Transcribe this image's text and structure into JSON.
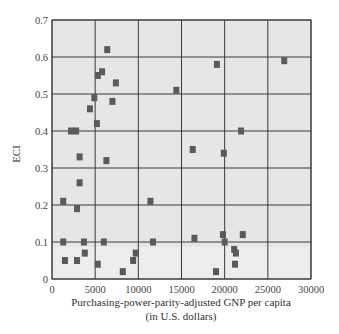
{
  "chart_data": {
    "type": "scatter",
    "title": "",
    "xlabel": "Purchasing-power-parity-adjusted GNP per capita",
    "xlabel_line2": "(in U.S. dollars)",
    "ylabel": "ECI",
    "xlim": [
      0,
      30000
    ],
    "ylim": [
      0,
      0.7
    ],
    "x_ticks": [
      "0",
      "5000",
      "10000",
      "15000",
      "20000",
      "25000",
      "30000"
    ],
    "y_ticks": [
      "0",
      "0.1",
      "0.2",
      "0.3",
      "0.4",
      "0.5",
      "0.6",
      "0.7"
    ],
    "grid": true,
    "legend": null,
    "colors": {
      "background": "#e6e6e6",
      "grid": "#3a3a3a",
      "marker": "#5a5a5a"
    },
    "points": [
      {
        "x": 6400,
        "y": 0.62
      },
      {
        "x": 5300,
        "y": 0.55
      },
      {
        "x": 5800,
        "y": 0.56
      },
      {
        "x": 7400,
        "y": 0.53
      },
      {
        "x": 4900,
        "y": 0.49
      },
      {
        "x": 7000,
        "y": 0.48
      },
      {
        "x": 4400,
        "y": 0.46
      },
      {
        "x": 5200,
        "y": 0.42
      },
      {
        "x": 2200,
        "y": 0.4
      },
      {
        "x": 2800,
        "y": 0.4
      },
      {
        "x": 3200,
        "y": 0.33
      },
      {
        "x": 6300,
        "y": 0.32
      },
      {
        "x": 3200,
        "y": 0.26
      },
      {
        "x": 1300,
        "y": 0.21
      },
      {
        "x": 2900,
        "y": 0.19
      },
      {
        "x": 1300,
        "y": 0.1
      },
      {
        "x": 3700,
        "y": 0.1
      },
      {
        "x": 6000,
        "y": 0.1
      },
      {
        "x": 1500,
        "y": 0.05
      },
      {
        "x": 2900,
        "y": 0.05
      },
      {
        "x": 3800,
        "y": 0.07
      },
      {
        "x": 5300,
        "y": 0.04
      },
      {
        "x": 8200,
        "y": 0.02
      },
      {
        "x": 9400,
        "y": 0.05
      },
      {
        "x": 9700,
        "y": 0.07
      },
      {
        "x": 11400,
        "y": 0.21
      },
      {
        "x": 11700,
        "y": 0.1
      },
      {
        "x": 14400,
        "y": 0.51
      },
      {
        "x": 16300,
        "y": 0.35
      },
      {
        "x": 16500,
        "y": 0.11
      },
      {
        "x": 19100,
        "y": 0.58
      },
      {
        "x": 19900,
        "y": 0.34
      },
      {
        "x": 19800,
        "y": 0.12
      },
      {
        "x": 20000,
        "y": 0.1
      },
      {
        "x": 21100,
        "y": 0.08
      },
      {
        "x": 21300,
        "y": 0.07
      },
      {
        "x": 21200,
        "y": 0.04
      },
      {
        "x": 19000,
        "y": 0.02
      },
      {
        "x": 21900,
        "y": 0.4
      },
      {
        "x": 22100,
        "y": 0.12
      },
      {
        "x": 26900,
        "y": 0.59
      }
    ]
  }
}
